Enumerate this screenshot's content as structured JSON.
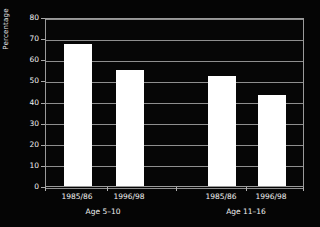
{
  "chart_data": {
    "type": "bar",
    "title": "",
    "xlabel": "",
    "ylabel": "Percentage",
    "ylim": [
      0,
      80
    ],
    "ytick_step": 10,
    "yticks": [
      "80",
      "70",
      "60",
      "50",
      "40",
      "30",
      "20",
      "10",
      "0"
    ],
    "grid": true,
    "legend": "none",
    "background_color": "#000000",
    "bar_color": "#ffffff",
    "grid_color": "#8e8e8e",
    "text_color": "#f2f2f2",
    "categories": [
      "1985/86",
      "1996/98",
      "1985/86",
      "1996/98"
    ],
    "values": [
      67,
      55,
      52,
      43
    ],
    "groups": [
      {
        "label": "Age 5–10",
        "categories": [
          "1985/86",
          "1996/98"
        ],
        "values": [
          67,
          55
        ]
      },
      {
        "label": "Age 11–16",
        "categories": [
          "1985/86",
          "1996/98"
        ],
        "values": [
          52,
          43
        ]
      }
    ],
    "bars": [
      {
        "label": "1985/86",
        "group": "Age 5–10",
        "value": 67
      },
      {
        "label": "1996/98",
        "group": "Age 5–10",
        "value": 55
      },
      {
        "label": "1985/86",
        "group": "Age 11–16",
        "value": 52
      },
      {
        "label": "1996/98",
        "group": "Age 11–16",
        "value": 43
      }
    ]
  }
}
